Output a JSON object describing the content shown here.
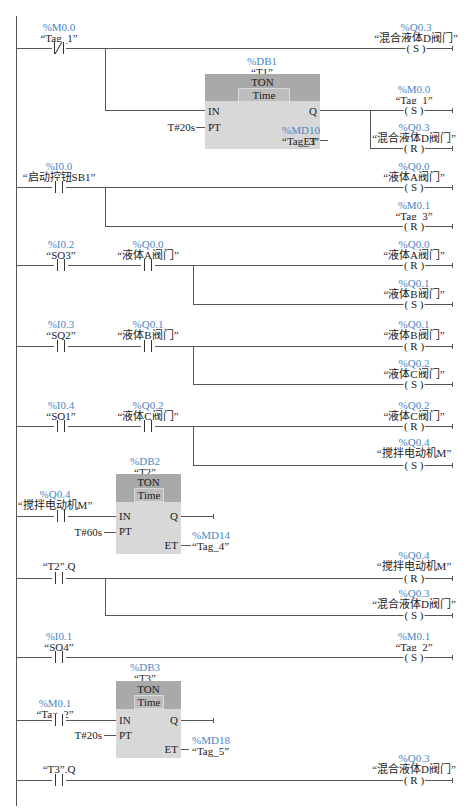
{
  "diagram": {
    "type": "ladder_logic",
    "networks": [
      {
        "id": 1,
        "contacts": [
          {
            "type": "NC",
            "address": "%M0.0",
            "name": "“Tag_1”"
          }
        ],
        "outputs": [
          {
            "address": "%Q0.3",
            "name": "“混合液体D阀门”",
            "coil": "( S )"
          }
        ],
        "timer": {
          "db": "%DB1",
          "name": "“T1”",
          "type": "TON",
          "time": "Time",
          "pins": {
            "in": "IN",
            "pt": "PT",
            "q": "Q",
            "et": "ET"
          },
          "pt_value": "T#20s",
          "et_address": "%MD10",
          "et_name": "“Tag_3”",
          "q_outputs": [
            {
              "address": "%M0.0",
              "name": "“Tag_1”",
              "coil": "( S )"
            },
            {
              "address": "%Q0.3",
              "name": "“混合液体D阀门”",
              "coil": "( R )"
            }
          ]
        }
      },
      {
        "id": 2,
        "contacts": [
          {
            "type": "NO",
            "address": "%I0.0",
            "name": "“启动控钮SB1”"
          }
        ],
        "outputs": [
          {
            "address": "%Q0.0",
            "name": "“液体A阀门”",
            "coil": "( S )"
          },
          {
            "address": "%M0.1",
            "name": "“Tag_3”",
            "coil": "( R )"
          }
        ]
      },
      {
        "id": 3,
        "contacts": [
          {
            "type": "NO",
            "address": "%I0.2",
            "name": "“SQ3”"
          },
          {
            "type": "NO",
            "address": "%Q0.0",
            "name": "“液体A阀门”"
          }
        ],
        "outputs": [
          {
            "address": "%Q0.0",
            "name": "“液体A阀门”",
            "coil": "( R )"
          },
          {
            "address": "%Q0.1",
            "name": "“液体B阀门”",
            "coil": "( S )"
          }
        ]
      },
      {
        "id": 4,
        "contacts": [
          {
            "type": "NO",
            "address": "%I0.3",
            "name": "“SQ2”"
          },
          {
            "type": "NO",
            "address": "%Q0.1",
            "name": "“液体B阀门”"
          }
        ],
        "outputs": [
          {
            "address": "%Q0.1",
            "name": "“液体B阀门”",
            "coil": "( R )"
          },
          {
            "address": "%Q0.2",
            "name": "“液体C阀门”",
            "coil": "( S )"
          }
        ]
      },
      {
        "id": 5,
        "contacts": [
          {
            "type": "NO",
            "address": "%I0.4",
            "name": "“SQ1”"
          },
          {
            "type": "NO",
            "address": "%Q0.2",
            "name": "“液体C阀门”"
          }
        ],
        "outputs": [
          {
            "address": "%Q0.2",
            "name": "“液体C阀门”",
            "coil": "( R )"
          },
          {
            "address": "%Q0.4",
            "name": "“搅拌电动机M”",
            "coil": "( S )"
          }
        ]
      },
      {
        "id": 6,
        "contacts": [
          {
            "type": "NO",
            "address": "%Q0.4",
            "name": "“搅拌电动机M”"
          }
        ],
        "timer": {
          "db": "%DB2",
          "name": "“T2”",
          "type": "TON",
          "time": "Time",
          "pins": {
            "in": "IN",
            "pt": "PT",
            "q": "Q",
            "et": "ET"
          },
          "pt_value": "T#60s",
          "et_address": "%MD14",
          "et_name": "“Tag_4”"
        }
      },
      {
        "id": 7,
        "contacts": [
          {
            "type": "NO",
            "address": "",
            "name": "“T2”.Q"
          }
        ],
        "outputs": [
          {
            "address": "%Q0.4",
            "name": "“搅拌电动机M”",
            "coil": "( R )"
          },
          {
            "address": "%Q0.3",
            "name": "“混合液体D阀门”",
            "coil": "( S )"
          }
        ]
      },
      {
        "id": 8,
        "contacts": [
          {
            "type": "NO",
            "address": "%I0.1",
            "name": "“SQ4”"
          }
        ],
        "outputs": [
          {
            "address": "%M0.1",
            "name": "“Tag_2”",
            "coil": "( S )"
          }
        ]
      },
      {
        "id": 9,
        "contacts": [
          {
            "type": "NO",
            "address": "%M0.1",
            "name": "“Tag_2”"
          }
        ],
        "timer": {
          "db": "%DB3",
          "name": "“T3”",
          "type": "TON",
          "time": "Time",
          "pins": {
            "in": "IN",
            "pt": "PT",
            "q": "Q",
            "et": "ET"
          },
          "pt_value": "T#20s",
          "et_address": "%MD18",
          "et_name": "“Tag_5”"
        }
      },
      {
        "id": 10,
        "contacts": [
          {
            "type": "NO",
            "address": "",
            "name": "“T3”.Q"
          }
        ],
        "outputs": [
          {
            "address": "%Q0.3",
            "name": "“混合液体D阀门”",
            "coil": "( R )"
          }
        ]
      }
    ]
  }
}
